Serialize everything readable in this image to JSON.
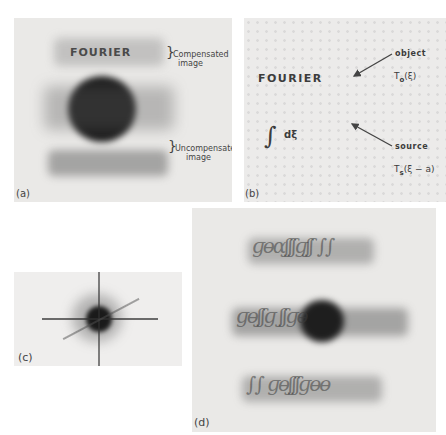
{
  "figure": {
    "panels": [
      {
        "id": "a",
        "label": "(a)",
        "word": "FOURIER",
        "annotations": [
          {
            "brace": "}",
            "line1": "Compensated",
            "line2": "image"
          },
          {
            "brace": "}",
            "line1": "Uncompensated",
            "line2": "image"
          }
        ]
      },
      {
        "id": "b",
        "label": "(b)",
        "word": "FOURIER",
        "integral": "∫",
        "differential": "dξ",
        "object_label": "object",
        "object_func": "T",
        "object_sub": "o",
        "object_arg": "(ξ)",
        "source_label": "source",
        "source_func": "T",
        "source_sub": "s",
        "source_arg": "(ξ − a)"
      },
      {
        "id": "c",
        "label": "(c)"
      },
      {
        "id": "d",
        "label": "(d)"
      }
    ]
  }
}
